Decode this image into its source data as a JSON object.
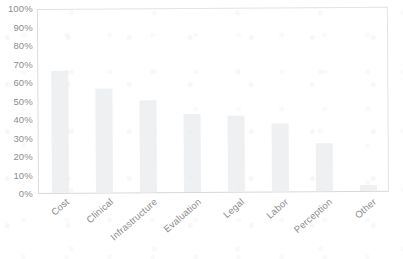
{
  "chart_data": {
    "type": "bar",
    "title": "",
    "subtitle": "",
    "xlabel": "",
    "ylabel": "",
    "categories": [
      "Cost",
      "Clinical",
      "Infrastructure",
      "Evaluation",
      "Legal",
      "Labor",
      "Perception",
      "Other"
    ],
    "values": [
      66,
      56,
      50,
      42,
      41,
      37,
      26,
      3
    ],
    "value_format": "percent",
    "ylim": [
      0,
      100
    ],
    "y_ticks": [
      "0%",
      "10%",
      "20%",
      "30%",
      "40%",
      "50%",
      "60%",
      "70%",
      "80%",
      "90%",
      "100%"
    ],
    "y_tick_values": [
      0,
      10,
      20,
      30,
      40,
      50,
      60,
      70,
      80,
      90,
      100
    ],
    "grid": false,
    "legend": false,
    "legend_position": "none",
    "series": [
      {
        "name": "Barriers",
        "values": [
          66,
          56,
          50,
          42,
          41,
          37,
          26,
          3
        ]
      }
    ],
    "colors": {
      "bar_fill": "#eef0f1",
      "axis_line": "#dcdcdc",
      "tick_label": "#8d8d8d",
      "background": "#ffffff"
    }
  }
}
